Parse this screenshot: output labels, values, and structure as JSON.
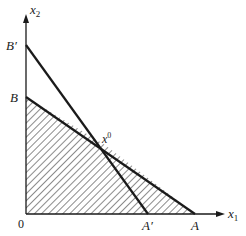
{
  "diagram": {
    "type": "linear-programming-feasible-region",
    "axes": {
      "x_label": "x",
      "x_subscript": "1",
      "y_label": "x",
      "y_subscript": "2",
      "origin_label": "0"
    },
    "points": {
      "B_prime": "B′",
      "B": "B",
      "x0_base": "x",
      "x0_sup": "0",
      "A_prime": "A′",
      "A": "A"
    },
    "lines": [
      {
        "name": "B-A",
        "from": "B",
        "to": "A"
      },
      {
        "name": "Bprime-Aprime",
        "from": "B′",
        "to": "A′"
      }
    ],
    "shaded_region": "polygon 0-B-x0-A (hatched)",
    "colors": {
      "line": "#1a1a1a",
      "hatch": "#2a2a2a",
      "background": "#ffffff"
    }
  }
}
